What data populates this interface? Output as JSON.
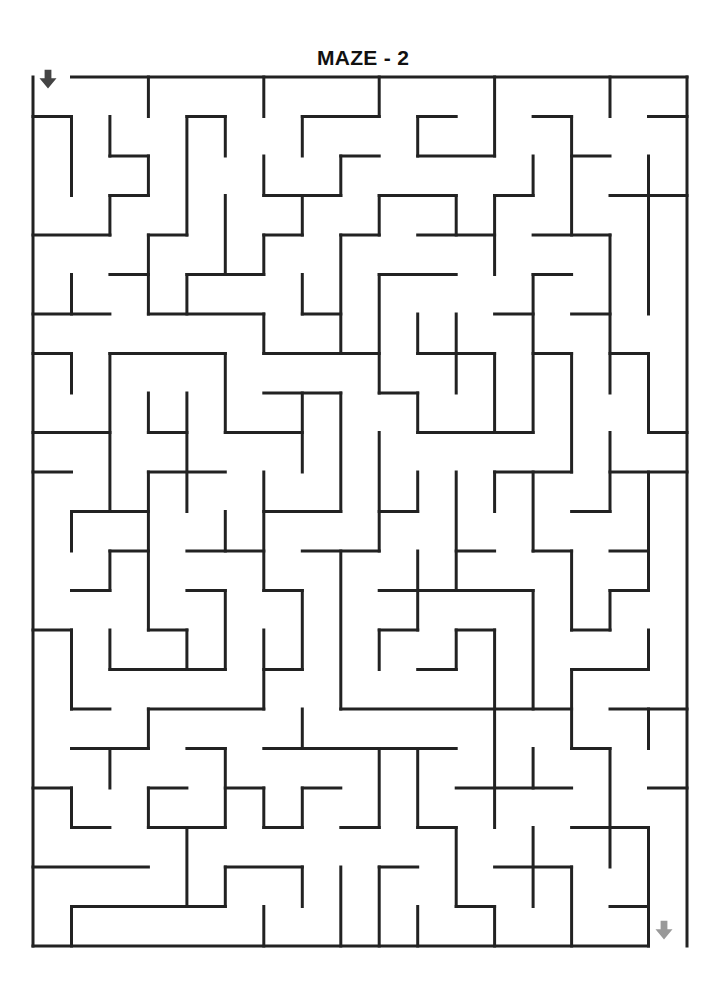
{
  "title": "MAZE - 2",
  "maze": {
    "cols": 17,
    "rows": 22,
    "origin": {
      "x": 33,
      "y": 77
    },
    "cell_w": 38.47,
    "cell_h": 39.5,
    "wall_color": "#222222",
    "entrance": {
      "label": "start-arrow",
      "col": 0,
      "color": "#444444",
      "x": 48,
      "y": 80
    },
    "exit": {
      "label": "finish-arrow",
      "col": 16,
      "color": "#999999",
      "x": 664,
      "y": 931
    },
    "h_walls": [
      [
        0,
        1,
        17
      ],
      [
        1,
        0,
        1
      ],
      [
        1,
        4,
        5
      ],
      [
        1,
        7,
        9
      ],
      [
        1,
        10,
        11
      ],
      [
        1,
        13,
        14
      ],
      [
        1,
        16,
        17
      ],
      [
        2,
        2,
        3
      ],
      [
        2,
        8,
        9
      ],
      [
        2,
        10,
        12
      ],
      [
        2,
        14,
        15
      ],
      [
        3,
        2,
        3
      ],
      [
        3,
        6,
        8
      ],
      [
        3,
        9,
        11
      ],
      [
        3,
        12,
        13
      ],
      [
        3,
        15,
        17
      ],
      [
        4,
        0,
        2
      ],
      [
        4,
        3,
        4
      ],
      [
        4,
        6,
        7
      ],
      [
        4,
        8,
        9
      ],
      [
        4,
        10,
        12
      ],
      [
        4,
        13,
        15
      ],
      [
        5,
        2,
        3
      ],
      [
        5,
        4,
        6
      ],
      [
        5,
        9,
        11
      ],
      [
        5,
        13,
        14
      ],
      [
        6,
        0,
        2
      ],
      [
        6,
        3,
        6
      ],
      [
        6,
        7,
        8
      ],
      [
        6,
        12,
        13
      ],
      [
        6,
        14,
        15
      ],
      [
        7,
        0,
        1
      ],
      [
        7,
        2,
        5
      ],
      [
        7,
        6,
        9
      ],
      [
        7,
        10,
        12
      ],
      [
        7,
        13,
        14
      ],
      [
        7,
        15,
        16
      ],
      [
        8,
        6,
        8
      ],
      [
        8,
        9,
        10
      ],
      [
        9,
        0,
        2
      ],
      [
        9,
        3,
        4
      ],
      [
        9,
        5,
        7
      ],
      [
        9,
        10,
        13
      ],
      [
        9,
        16,
        17
      ],
      [
        10,
        0,
        1
      ],
      [
        10,
        3,
        5
      ],
      [
        10,
        12,
        14
      ],
      [
        10,
        15,
        17
      ],
      [
        11,
        1,
        3
      ],
      [
        11,
        6,
        8
      ],
      [
        11,
        9,
        10
      ],
      [
        11,
        14,
        15
      ],
      [
        12,
        2,
        3
      ],
      [
        12,
        4,
        6
      ],
      [
        12,
        7,
        9
      ],
      [
        12,
        11,
        12
      ],
      [
        12,
        13,
        14
      ],
      [
        12,
        15,
        16
      ],
      [
        13,
        1,
        2
      ],
      [
        13,
        4,
        5
      ],
      [
        13,
        6,
        7
      ],
      [
        13,
        9,
        13
      ],
      [
        13,
        15,
        16
      ],
      [
        14,
        0,
        1
      ],
      [
        14,
        3,
        4
      ],
      [
        14,
        9,
        10
      ],
      [
        14,
        11,
        12
      ],
      [
        14,
        14,
        15
      ],
      [
        15,
        2,
        5
      ],
      [
        15,
        6,
        7
      ],
      [
        15,
        10,
        11
      ],
      [
        15,
        14,
        16
      ],
      [
        16,
        1,
        2
      ],
      [
        16,
        3,
        6
      ],
      [
        16,
        8,
        14
      ],
      [
        16,
        15,
        17
      ],
      [
        17,
        1,
        3
      ],
      [
        17,
        4,
        5
      ],
      [
        17,
        6,
        11
      ],
      [
        17,
        14,
        15
      ],
      [
        18,
        0,
        1
      ],
      [
        18,
        3,
        4
      ],
      [
        18,
        5,
        6
      ],
      [
        18,
        7,
        8
      ],
      [
        18,
        11,
        14
      ],
      [
        18,
        16,
        17
      ],
      [
        19,
        1,
        2
      ],
      [
        19,
        3,
        5
      ],
      [
        19,
        6,
        7
      ],
      [
        19,
        8,
        9
      ],
      [
        19,
        10,
        11
      ],
      [
        19,
        14,
        16
      ],
      [
        20,
        0,
        3
      ],
      [
        20,
        5,
        7
      ],
      [
        20,
        9,
        10
      ],
      [
        20,
        12,
        14
      ],
      [
        21,
        1,
        5
      ],
      [
        21,
        11,
        12
      ],
      [
        21,
        15,
        16
      ],
      [
        22,
        0,
        16
      ]
    ],
    "v_walls": [
      [
        0,
        0,
        22
      ],
      [
        1,
        1,
        3
      ],
      [
        1,
        5,
        6
      ],
      [
        1,
        7,
        8
      ],
      [
        1,
        11,
        12
      ],
      [
        1,
        14,
        16
      ],
      [
        1,
        18,
        19
      ],
      [
        1,
        21,
        22
      ],
      [
        2,
        1,
        2
      ],
      [
        2,
        3,
        4
      ],
      [
        2,
        7,
        11
      ],
      [
        2,
        12,
        13
      ],
      [
        2,
        14,
        15
      ],
      [
        2,
        17,
        18
      ],
      [
        3,
        0,
        1
      ],
      [
        3,
        2,
        3
      ],
      [
        3,
        4,
        6
      ],
      [
        3,
        8,
        9
      ],
      [
        3,
        10,
        14
      ],
      [
        3,
        16,
        17
      ],
      [
        3,
        18,
        19
      ],
      [
        4,
        1,
        4
      ],
      [
        4,
        5,
        6
      ],
      [
        4,
        8,
        11
      ],
      [
        4,
        14,
        15
      ],
      [
        4,
        19,
        21
      ],
      [
        5,
        1,
        2
      ],
      [
        5,
        3,
        5
      ],
      [
        5,
        7,
        9
      ],
      [
        5,
        11,
        12
      ],
      [
        5,
        13,
        15
      ],
      [
        5,
        17,
        19
      ],
      [
        5,
        20,
        21
      ],
      [
        6,
        0,
        1
      ],
      [
        6,
        2,
        3
      ],
      [
        6,
        4,
        5
      ],
      [
        6,
        6,
        7
      ],
      [
        6,
        10,
        13
      ],
      [
        6,
        14,
        16
      ],
      [
        6,
        18,
        19
      ],
      [
        6,
        21,
        22
      ],
      [
        7,
        1,
        2
      ],
      [
        7,
        3,
        4
      ],
      [
        7,
        5,
        6
      ],
      [
        7,
        8,
        10
      ],
      [
        7,
        13,
        15
      ],
      [
        7,
        16,
        17
      ],
      [
        7,
        18,
        19
      ],
      [
        7,
        20,
        21
      ],
      [
        8,
        2,
        3
      ],
      [
        8,
        4,
        7
      ],
      [
        8,
        8,
        11
      ],
      [
        8,
        12,
        16
      ],
      [
        8,
        20,
        22
      ],
      [
        9,
        0,
        1
      ],
      [
        9,
        3,
        4
      ],
      [
        9,
        5,
        8
      ],
      [
        9,
        9,
        12
      ],
      [
        9,
        14,
        15
      ],
      [
        9,
        17,
        19
      ],
      [
        9,
        20,
        22
      ],
      [
        10,
        1,
        2
      ],
      [
        10,
        6,
        7
      ],
      [
        10,
        8,
        9
      ],
      [
        10,
        10,
        11
      ],
      [
        10,
        12,
        14
      ],
      [
        10,
        17,
        19
      ],
      [
        10,
        21,
        22
      ],
      [
        11,
        3,
        4
      ],
      [
        11,
        6,
        8
      ],
      [
        11,
        10,
        13
      ],
      [
        11,
        14,
        15
      ],
      [
        11,
        19,
        21
      ],
      [
        12,
        0,
        2
      ],
      [
        12,
        3,
        5
      ],
      [
        12,
        7,
        9
      ],
      [
        12,
        10,
        11
      ],
      [
        12,
        14,
        19
      ],
      [
        12,
        21,
        22
      ],
      [
        13,
        2,
        3
      ],
      [
        13,
        5,
        9
      ],
      [
        13,
        10,
        12
      ],
      [
        13,
        13,
        16
      ],
      [
        13,
        17,
        18
      ],
      [
        13,
        19,
        21
      ],
      [
        14,
        1,
        4
      ],
      [
        14,
        7,
        10
      ],
      [
        14,
        12,
        14
      ],
      [
        14,
        15,
        17
      ],
      [
        14,
        20,
        22
      ],
      [
        15,
        0,
        1
      ],
      [
        15,
        4,
        8
      ],
      [
        15,
        9,
        11
      ],
      [
        15,
        13,
        14
      ],
      [
        15,
        17,
        20
      ],
      [
        16,
        2,
        6
      ],
      [
        16,
        7,
        9
      ],
      [
        16,
        10,
        13
      ],
      [
        16,
        14,
        15
      ],
      [
        16,
        16,
        17
      ],
      [
        16,
        19,
        22
      ],
      [
        17,
        0,
        22
      ]
    ]
  }
}
